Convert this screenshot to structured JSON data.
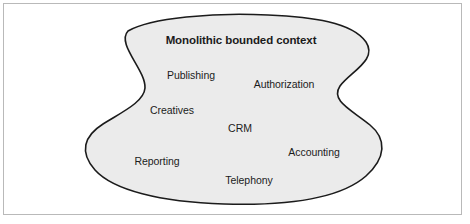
{
  "figure": {
    "kind": "bounded-context-blob-diagram",
    "frame": {
      "border_color": "#b9b9b9",
      "background_color": "#ffffff"
    },
    "blob": {
      "name": "monolithic-bounded-context-blob",
      "fill_color": "#ebebeb",
      "stroke_color": "#1b1b1b",
      "stroke_width": 1.6
    },
    "title": "Monolithic bounded context",
    "subdomains": [
      {
        "label": "Publishing",
        "x": 191,
        "y": 75
      },
      {
        "label": "Authorization",
        "x": 284,
        "y": 84
      },
      {
        "label": "Creatives",
        "x": 172,
        "y": 110
      },
      {
        "label": "CRM",
        "x": 240,
        "y": 128
      },
      {
        "label": "Accounting",
        "x": 314,
        "y": 152
      },
      {
        "label": "Reporting",
        "x": 157,
        "y": 161
      },
      {
        "label": "Telephony",
        "x": 249,
        "y": 180
      }
    ]
  }
}
